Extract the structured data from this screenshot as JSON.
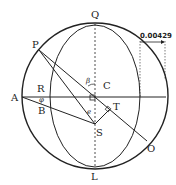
{
  "labels": {
    "Q": "Q",
    "L": "L",
    "P": "P",
    "O": "O",
    "A": "A",
    "R": "R",
    "B": "B",
    "C": "C",
    "T": "T",
    "S": "S",
    "beta": "β",
    "phi": "φ",
    "epsilon": "e"
  },
  "measurement": "0.00429",
  "colors": {
    "stroke": "#222222",
    "background": "#ffffff"
  }
}
